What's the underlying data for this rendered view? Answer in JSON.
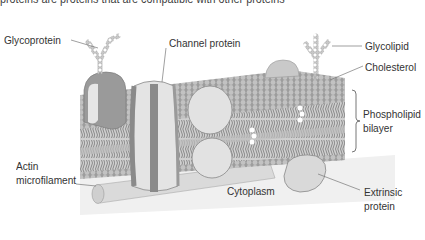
{
  "header": {
    "cropped_caption": "proteins are proteins that are compatible with other proteins"
  },
  "diagram": {
    "colors": {
      "membrane_head": "#b9b9b9",
      "membrane_dark": "#8f8f8f",
      "protein_light": "#e4e4e4",
      "protein_dark": "#8a8a8a",
      "cytoplasm": "#f1f1f1",
      "leader": "#777777"
    },
    "labels": {
      "glycoprotein": "Glycoprotein",
      "channel_protein": "Channel protein",
      "glycolipid": "Glycolipid",
      "cholesterol": "Cholesterol",
      "phospholipid_line1": "Phospholipid",
      "phospholipid_line2": "bilayer",
      "actin_line1": "Actin",
      "actin_line2": "microfilament",
      "cytoplasm": "Cytoplasm",
      "extrinsic_line1": "Extrinsic",
      "extrinsic_line2": "protein"
    }
  }
}
